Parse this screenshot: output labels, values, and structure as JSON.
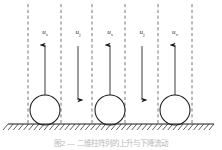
{
  "figure": {
    "caption": "图2 — 二维柱阵列的上升与下降流动",
    "ground_label": "hatched-ground",
    "colors": {
      "stroke": "#1a1a1a",
      "dashed": "#555555",
      "background": "#ffffff",
      "caption": "#b9b9b9"
    }
  },
  "dashed_lines": [
    {
      "name": "boundary-line-1",
      "x": 28
    },
    {
      "name": "boundary-line-2",
      "x": 61
    },
    {
      "name": "boundary-line-3",
      "x": 92
    },
    {
      "name": "boundary-line-4",
      "x": 125
    },
    {
      "name": "boundary-line-5",
      "x": 158
    },
    {
      "name": "boundary-line-6",
      "x": 192
    }
  ],
  "circles": [
    {
      "name": "cylinder-1",
      "cx": 45,
      "cy": 110,
      "r": 15
    },
    {
      "name": "cylinder-2",
      "cx": 110,
      "cy": 110,
      "r": 15
    },
    {
      "name": "cylinder-3",
      "cx": 175,
      "cy": 110,
      "r": 15
    }
  ],
  "arrows": [
    {
      "name": "arrow-up-1",
      "x": 45,
      "y_tail": 104,
      "y_head": 45,
      "direction": "up"
    },
    {
      "name": "arrow-down-1",
      "x": 78,
      "y_tail": 46,
      "y_head": 100,
      "direction": "down"
    },
    {
      "name": "arrow-up-2",
      "x": 110,
      "y_tail": 104,
      "y_head": 45,
      "direction": "up"
    },
    {
      "name": "arrow-down-2",
      "x": 142,
      "y_tail": 46,
      "y_head": 100,
      "direction": "down"
    },
    {
      "name": "arrow-up-3",
      "x": 175,
      "y_tail": 104,
      "y_head": 45,
      "direction": "up"
    }
  ],
  "labels": [
    {
      "name": "label-u-s-1",
      "x": 45,
      "y": 28,
      "symbol": "u",
      "subscript": "s"
    },
    {
      "name": "label-u-j-1",
      "x": 78,
      "y": 28,
      "symbol": "u",
      "subscript": "j"
    },
    {
      "name": "label-u-s-2",
      "x": 110,
      "y": 28,
      "symbol": "u",
      "subscript": "s"
    },
    {
      "name": "label-u-j-2",
      "x": 142,
      "y": 28,
      "symbol": "u",
      "subscript": "j"
    },
    {
      "name": "label-u-s-3",
      "x": 175,
      "y": 28,
      "symbol": "u",
      "subscript": "v"
    }
  ],
  "ground": {
    "name": "ground-surface",
    "y": 124,
    "x_start": 8,
    "x_end": 214,
    "hatch_count": 40
  }
}
